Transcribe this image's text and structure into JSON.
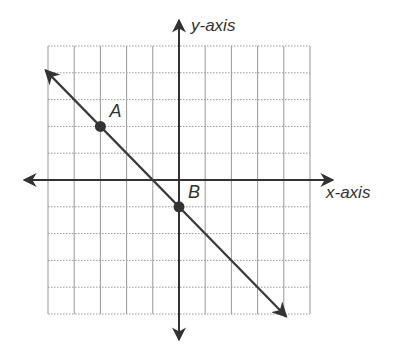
{
  "figure": {
    "type": "coordinate-plane",
    "grid": {
      "x_min": -5,
      "x_max": 5,
      "y_min": -5,
      "y_max": 5,
      "step": 1,
      "gridline_style": "dotted"
    },
    "axes": {
      "x_label": "x-axis",
      "y_label": "y-axis"
    },
    "line": {
      "description": "line through A and B, arrows on both ends",
      "slope": -1,
      "y_intercept": -1,
      "start": [
        -5.1,
        4.1
      ],
      "end": [
        4.1,
        -5.1
      ]
    },
    "points": [
      {
        "label": "A",
        "x": -3,
        "y": 2
      },
      {
        "label": "B",
        "x": 0,
        "y": -1
      }
    ],
    "colors": {
      "axis": "#333333",
      "line": "#3a3a3a",
      "grid": "#999999",
      "point": "#333333",
      "text": "#333333"
    }
  }
}
